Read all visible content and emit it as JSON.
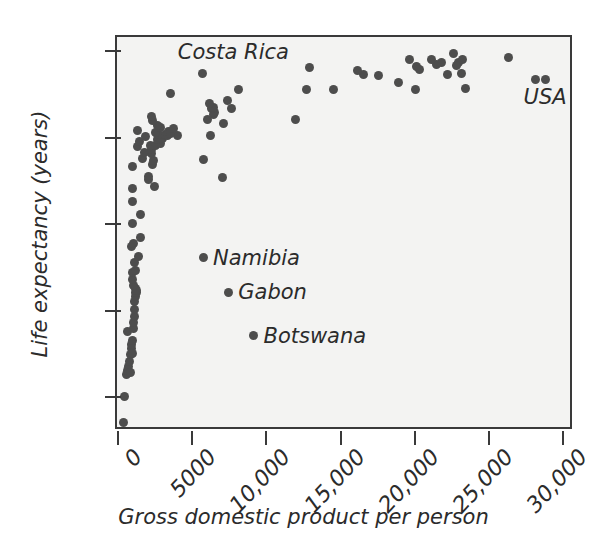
{
  "chart_data": {
    "type": "scatter",
    "title": "",
    "xlabel": "Gross domestic product per person",
    "ylabel": "Life expectancy (years)",
    "xlim": [
      0,
      30800
    ],
    "ylim": [
      36,
      81.5
    ],
    "xticks": [
      0,
      5000,
      10000,
      15000,
      20000,
      25000,
      30000
    ],
    "xtick_labels": [
      "0",
      "5000",
      "10,000",
      "15,000",
      "20,000",
      "25,000",
      "30,000"
    ],
    "yticks": [
      40,
      50,
      60,
      70,
      80
    ],
    "ytick_labels": [
      "40",
      "50",
      "60",
      "70",
      "80"
    ],
    "grid": false,
    "legend": "none",
    "marker_color": "#4d4d4d",
    "plot_background": "#f3f3f2",
    "frame_color": "#3a3a3a",
    "annotations": [
      {
        "text": "Costa Rica",
        "x": 4100,
        "y": 79.8,
        "has_dot": false
      },
      {
        "text": "Namibia",
        "x": 5800,
        "y": 56.0,
        "has_dot": true
      },
      {
        "text": "Gabon",
        "x": 7500,
        "y": 52.0,
        "has_dot": true
      },
      {
        "text": "Botswana",
        "x": 9200,
        "y": 47.0,
        "has_dot": true
      },
      {
        "text": "USA",
        "x": 27400,
        "y": 74.6,
        "has_dot": false
      }
    ],
    "points": [
      {
        "x": 450,
        "y": 37.0
      },
      {
        "x": 480,
        "y": 40.0
      },
      {
        "x": 620,
        "y": 42.5
      },
      {
        "x": 700,
        "y": 43.0
      },
      {
        "x": 760,
        "y": 43.4
      },
      {
        "x": 820,
        "y": 44.0
      },
      {
        "x": 880,
        "y": 42.8
      },
      {
        "x": 900,
        "y": 44.8
      },
      {
        "x": 950,
        "y": 45.5
      },
      {
        "x": 980,
        "y": 46.0
      },
      {
        "x": 700,
        "y": 47.5
      },
      {
        "x": 1020,
        "y": 46.5
      },
      {
        "x": 1050,
        "y": 45.0
      },
      {
        "x": 1080,
        "y": 47.8
      },
      {
        "x": 1100,
        "y": 48.5
      },
      {
        "x": 1150,
        "y": 49.2
      },
      {
        "x": 1180,
        "y": 50.0
      },
      {
        "x": 1200,
        "y": 51.0
      },
      {
        "x": 1220,
        "y": 51.5
      },
      {
        "x": 1250,
        "y": 52.0
      },
      {
        "x": 1280,
        "y": 52.4
      },
      {
        "x": 1300,
        "y": 52.0
      },
      {
        "x": 1340,
        "y": 52.2
      },
      {
        "x": 1100,
        "y": 52.8
      },
      {
        "x": 1060,
        "y": 53.5
      },
      {
        "x": 1020,
        "y": 54.3
      },
      {
        "x": 1250,
        "y": 54.5
      },
      {
        "x": 1150,
        "y": 55.5
      },
      {
        "x": 1450,
        "y": 56.2
      },
      {
        "x": 1000,
        "y": 57.3
      },
      {
        "x": 1080,
        "y": 57.6
      },
      {
        "x": 1600,
        "y": 58.3
      },
      {
        "x": 1030,
        "y": 60.0
      },
      {
        "x": 1600,
        "y": 61.0
      },
      {
        "x": 1050,
        "y": 62.5
      },
      {
        "x": 1060,
        "y": 64.0
      },
      {
        "x": 2550,
        "y": 64.2
      },
      {
        "x": 2100,
        "y": 65.0
      },
      {
        "x": 2150,
        "y": 65.4
      },
      {
        "x": 7100,
        "y": 65.3
      },
      {
        "x": 1020,
        "y": 66.5
      },
      {
        "x": 2400,
        "y": 66.8
      },
      {
        "x": 2480,
        "y": 67.2
      },
      {
        "x": 1750,
        "y": 67.5
      },
      {
        "x": 5800,
        "y": 67.3
      },
      {
        "x": 1850,
        "y": 68.2
      },
      {
        "x": 2300,
        "y": 68.0
      },
      {
        "x": 2350,
        "y": 68.5
      },
      {
        "x": 1400,
        "y": 68.8
      },
      {
        "x": 2250,
        "y": 69.0
      },
      {
        "x": 2600,
        "y": 69.0
      },
      {
        "x": 2950,
        "y": 69.2
      },
      {
        "x": 1500,
        "y": 69.4
      },
      {
        "x": 2700,
        "y": 69.7
      },
      {
        "x": 3100,
        "y": 69.8
      },
      {
        "x": 1900,
        "y": 70.0
      },
      {
        "x": 2800,
        "y": 70.2
      },
      {
        "x": 3300,
        "y": 70.2
      },
      {
        "x": 3400,
        "y": 70.1
      },
      {
        "x": 4100,
        "y": 70.1
      },
      {
        "x": 6300,
        "y": 70.1
      },
      {
        "x": 2600,
        "y": 70.5
      },
      {
        "x": 3500,
        "y": 70.6
      },
      {
        "x": 3600,
        "y": 70.4
      },
      {
        "x": 1380,
        "y": 70.7
      },
      {
        "x": 2900,
        "y": 71.0
      },
      {
        "x": 3800,
        "y": 70.9
      },
      {
        "x": 2750,
        "y": 71.3
      },
      {
        "x": 7200,
        "y": 71.5
      },
      {
        "x": 2400,
        "y": 71.8
      },
      {
        "x": 6100,
        "y": 72.0
      },
      {
        "x": 12000,
        "y": 72.0
      },
      {
        "x": 6500,
        "y": 72.6
      },
      {
        "x": 6600,
        "y": 72.8
      },
      {
        "x": 2300,
        "y": 72.3
      },
      {
        "x": 6400,
        "y": 73.3
      },
      {
        "x": 6500,
        "y": 73.4
      },
      {
        "x": 7700,
        "y": 73.2
      },
      {
        "x": 6250,
        "y": 73.8
      },
      {
        "x": 7450,
        "y": 74.2
      },
      {
        "x": 3600,
        "y": 75.0
      },
      {
        "x": 8200,
        "y": 75.4
      },
      {
        "x": 12800,
        "y": 75.4
      },
      {
        "x": 14600,
        "y": 75.4
      },
      {
        "x": 20100,
        "y": 75.4
      },
      {
        "x": 23500,
        "y": 75.5
      },
      {
        "x": 19000,
        "y": 76.3
      },
      {
        "x": 28200,
        "y": 76.6
      },
      {
        "x": 28900,
        "y": 76.6
      },
      {
        "x": 17600,
        "y": 77.0
      },
      {
        "x": 16600,
        "y": 77.2
      },
      {
        "x": 22300,
        "y": 77.2
      },
      {
        "x": 23200,
        "y": 77.3
      },
      {
        "x": 16200,
        "y": 77.6
      },
      {
        "x": 5750,
        "y": 77.3
      },
      {
        "x": 13000,
        "y": 78.0
      },
      {
        "x": 20200,
        "y": 78.1
      },
      {
        "x": 20400,
        "y": 77.8
      },
      {
        "x": 21500,
        "y": 78.3
      },
      {
        "x": 21900,
        "y": 78.6
      },
      {
        "x": 23000,
        "y": 78.6
      },
      {
        "x": 22900,
        "y": 78.2
      },
      {
        "x": 19700,
        "y": 78.9
      },
      {
        "x": 21200,
        "y": 78.9
      },
      {
        "x": 23300,
        "y": 78.9
      },
      {
        "x": 26400,
        "y": 79.1
      },
      {
        "x": 22700,
        "y": 79.6
      }
    ]
  }
}
